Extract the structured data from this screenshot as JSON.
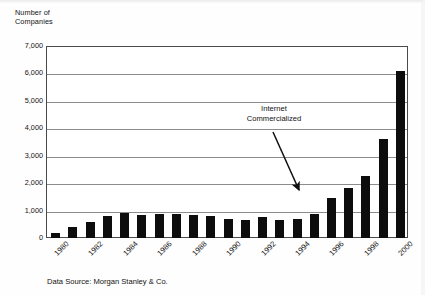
{
  "chart_data": {
    "type": "bar",
    "title": "",
    "ylabel": "Number of\nCompanies",
    "xlabel": "",
    "ylim": [
      0,
      7000
    ],
    "ytick_labels": [
      "7,000",
      "6,000",
      "5,000",
      "4,000",
      "3,000",
      "2,000",
      "1,000",
      "0"
    ],
    "ytick_values": [
      7000,
      6000,
      5000,
      4000,
      3000,
      2000,
      1000,
      0
    ],
    "grid": true,
    "legend": null,
    "categories": [
      "1980",
      "1981",
      "1982",
      "1983",
      "1984",
      "1985",
      "1986",
      "1987",
      "1988",
      "1989",
      "1990",
      "1991",
      "1992",
      "1993",
      "1994",
      "1995",
      "1996",
      "1997",
      "1998",
      "1999",
      "2000"
    ],
    "xtick_labels": [
      "1980",
      "1982",
      "1984",
      "1986",
      "1988",
      "1990",
      "1992",
      "1994",
      "1996",
      "1998",
      "2000"
    ],
    "values": [
      200,
      400,
      570,
      800,
      910,
      850,
      860,
      880,
      830,
      820,
      700,
      640,
      750,
      670,
      710,
      870,
      1450,
      1820,
      2250,
      3600,
      6100
    ],
    "bar_color": "#0d0d0d",
    "annotations": [
      {
        "text": "Internet\nCommercialized",
        "arrow_from": [
          273,
          132
        ],
        "arrow_to": [
          302,
          194
        ]
      }
    ],
    "source_note": "Data Source: Morgan Stanley & Co."
  },
  "figure": {
    "axis_title": "Number of\nCompanies",
    "annotation_text": "Internet\nCommercialized",
    "source_note": "Data Source: Morgan Stanley & Co."
  }
}
